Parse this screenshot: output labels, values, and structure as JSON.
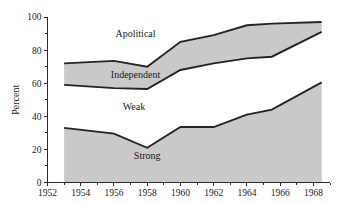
{
  "chart_data": {
    "type": "area",
    "title": "",
    "subtitle": "",
    "xlabel": "",
    "ylabel": "Percent",
    "xlim": [
      1952,
      1969
    ],
    "ylim": [
      0,
      100
    ],
    "grid": false,
    "legend_position": "inline-labels",
    "stacking": "stacked-cumulative",
    "x": [
      1953,
      1956,
      1958,
      1960,
      1962,
      1964,
      1965.5,
      1968.5
    ],
    "y_tick_labels": [
      "0",
      "20",
      "40",
      "60",
      "80",
      "100"
    ],
    "y_tick_values": [
      0,
      20,
      40,
      60,
      80,
      100
    ],
    "y_minor_tick_values": [
      10,
      30,
      50,
      70,
      90
    ],
    "x_tick_labels": [
      "1952",
      "1954",
      "1956",
      "1958",
      "1960",
      "1962",
      "1964",
      "1966",
      "1968"
    ],
    "x_tick_values": [
      1952,
      1954,
      1956,
      1958,
      1960,
      1962,
      1964,
      1966,
      1968
    ],
    "x_minor_tick_values": [
      1953,
      1955,
      1957,
      1959,
      1961,
      1963,
      1965,
      1967,
      1969
    ],
    "series": [
      {
        "name": "Strong",
        "label": "Strong",
        "shaded": true,
        "cumulative_values": [
          33,
          29.5,
          21,
          33.5,
          33.5,
          41,
          44,
          60.5
        ],
        "values": [
          33,
          29.5,
          21,
          33.5,
          33.5,
          41,
          44,
          60.5
        ]
      },
      {
        "name": "Weak",
        "label": "Weak",
        "shaded": false,
        "cumulative_values": [
          59,
          57,
          56.5,
          68,
          72,
          75,
          76,
          91
        ],
        "values": [
          26,
          27.5,
          35.5,
          34.5,
          38.5,
          34,
          32,
          30.5
        ]
      },
      {
        "name": "Independent",
        "label": "Independent",
        "shaded": true,
        "cumulative_values": [
          72,
          73.5,
          70,
          85,
          89,
          95,
          96,
          97
        ],
        "values": [
          13,
          16.5,
          13.5,
          17,
          17,
          20,
          20,
          6
        ]
      },
      {
        "name": "Apolitical",
        "label": "Apolitical",
        "shaded": false,
        "cumulative_values": [
          100,
          100,
          100,
          100,
          100,
          100,
          100,
          100
        ],
        "values": [
          28,
          26.5,
          30,
          15,
          11,
          5,
          4,
          3
        ]
      }
    ],
    "band_label_positions": [
      {
        "name": "Apolitical",
        "x": 1957.3,
        "y": 88
      },
      {
        "name": "Independent",
        "x": 1957.3,
        "y": 63
      },
      {
        "name": "Weak",
        "x": 1957.2,
        "y": 44
      },
      {
        "name": "Strong",
        "x": 1958.0,
        "y": 14
      }
    ],
    "colors": {
      "shaded_fill": "#c9c9c9",
      "line": "#242424",
      "axis": "#2b2b2b",
      "background": "#ffffff",
      "text": "#1a1a1a"
    }
  }
}
